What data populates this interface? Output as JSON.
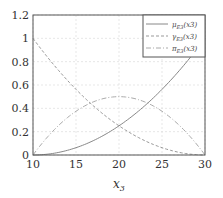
{
  "chart_data": {
    "type": "line",
    "title": "",
    "xlabel": "x3",
    "ylabel": "",
    "xlim": [
      10,
      30
    ],
    "ylim": [
      0,
      1.2
    ],
    "grid": true,
    "legend_position": "upper right",
    "x_ticks": [
      "10",
      "15",
      "20",
      "25",
      "30"
    ],
    "y_ticks": [
      "0",
      "0.2",
      "0.4",
      "0.6",
      "0.8",
      "1",
      "1.2"
    ],
    "x": [
      10,
      12,
      14,
      16,
      18,
      20,
      22,
      24,
      26,
      28,
      30
    ],
    "series": [
      {
        "name": "μE3(x3)",
        "style": "solid",
        "values": [
          0,
          0.01,
          0.04,
          0.09,
          0.16,
          0.25,
          0.36,
          0.49,
          0.64,
          0.81,
          1.0
        ]
      },
      {
        "name": "γE3(x3)",
        "style": "dashed",
        "values": [
          1.0,
          0.81,
          0.64,
          0.49,
          0.36,
          0.25,
          0.16,
          0.09,
          0.04,
          0.01,
          0
        ]
      },
      {
        "name": "πE3(x3)",
        "style": "dashdot",
        "values": [
          0,
          0.18,
          0.32,
          0.42,
          0.48,
          0.5,
          0.48,
          0.42,
          0.32,
          0.18,
          0
        ]
      }
    ]
  },
  "legend": {
    "mu": "μ",
    "gamma": "γ",
    "pi": "π",
    "sub": "E3",
    "arg": "(x3)"
  }
}
